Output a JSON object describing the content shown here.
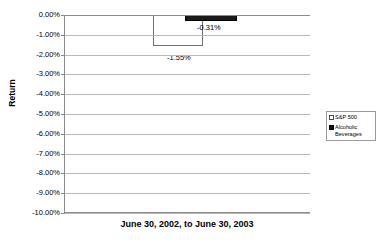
{
  "chart_data": {
    "type": "bar",
    "title": "",
    "subtitle": "",
    "xlabel": "June 30, 2002, to June 30, 2003",
    "ylabel": "Return",
    "categories": [
      "June 30, 2002, to June 30, 2003"
    ],
    "series": [
      {
        "name": "S&P 500",
        "values": [
          -1.55
        ],
        "data_label": "-1.55%",
        "color": "#ffffff",
        "edge_color": "#6e6e6e"
      },
      {
        "name": "Alcoholic Beverages",
        "values": [
          -0.31
        ],
        "data_label": "-0.31%",
        "color": "#1a1a1a",
        "edge_color": "#000000"
      }
    ],
    "ylim": [
      -10.0,
      0.0
    ],
    "ytick_labels": [
      "0.00%",
      "-1.00%",
      "-2.00%",
      "-3.00%",
      "-4.00%",
      "-5.00%",
      "-6.00%",
      "-7.00%",
      "-8.00%",
      "-9.00%",
      "-10.00%"
    ],
    "ytick_values": [
      0,
      -1,
      -2,
      -3,
      -4,
      -5,
      -6,
      -7,
      -8,
      -9,
      -10
    ],
    "grid": true,
    "grid_axis": "y",
    "legend_position": "right-outside",
    "legend_entries": [
      {
        "label": "S&P 500",
        "marker": "hollow-square"
      },
      {
        "label": "Alcoholic Beverages",
        "marker": "filled-square"
      }
    ]
  },
  "axis": {
    "y_title": "Return",
    "x_title": "June 30, 2002, to June 30, 2003"
  },
  "labels": {
    "sp500_value": "-1.55%",
    "alcohol_value": "-0.31%"
  },
  "legend": {
    "item_sp500": "S&P 500",
    "item_alcohol": "Alcoholic Beverages"
  }
}
